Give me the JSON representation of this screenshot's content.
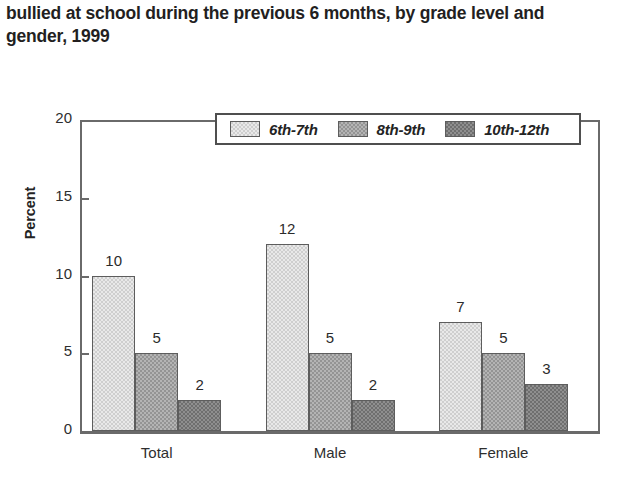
{
  "title": "bullied at school during the previous 6 months, by grade level and gender, 1999",
  "chart_data": {
    "type": "bar",
    "title": "bullied at school during the previous 6 months, by grade level and gender, 1999",
    "xlabel": "",
    "ylabel": "Percent",
    "ylim": [
      0,
      20
    ],
    "yticks": [
      0,
      5,
      10,
      15,
      20
    ],
    "ytick_labels": [
      "0",
      "5",
      "10",
      "15",
      "20"
    ],
    "grid": false,
    "legend_position": "top-center",
    "categories": [
      "Total",
      "Male",
      "Female"
    ],
    "series": [
      {
        "name": "6th-7th",
        "color": "#cfcfcf",
        "values": [
          10,
          12,
          7
        ]
      },
      {
        "name": "8th-9th",
        "color": "#949494",
        "values": [
          5,
          5,
          5
        ]
      },
      {
        "name": "10th-12th",
        "color": "#6f6f6f",
        "values": [
          2,
          2,
          3
        ]
      }
    ],
    "data_labels": [
      [
        "10",
        "5",
        "2"
      ],
      [
        "12",
        "5",
        "2"
      ],
      [
        "7",
        "5",
        "3"
      ]
    ]
  }
}
